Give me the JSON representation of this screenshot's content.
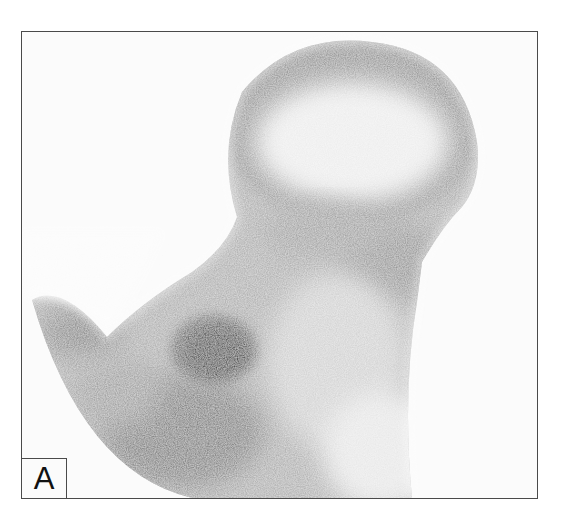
{
  "figure": {
    "panel_label": "A",
    "colors": {
      "background": "#fbfbfb",
      "border": "#4a4a4a",
      "uptake_dark": "#111111",
      "uptake_mid": "#6e6e6e",
      "uptake_light": "#c8c8c8"
    }
  }
}
